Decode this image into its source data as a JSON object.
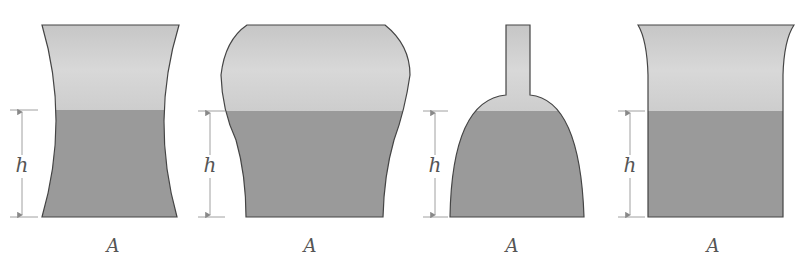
{
  "figure": {
    "colors": {
      "liquid": "#9a9a9a",
      "air_top": "#d4d4d4",
      "outline": "#444444",
      "dimension": "#888888"
    },
    "containers": [
      {
        "id": "concave-vessel",
        "height_label": "h",
        "base_label": "A"
      },
      {
        "id": "bulging-vessel",
        "height_label": "h",
        "base_label": "A"
      },
      {
        "id": "flask-vessel",
        "height_label": "h",
        "base_label": "A"
      },
      {
        "id": "flared-vessel",
        "height_label": "h",
        "base_label": "A"
      }
    ]
  }
}
